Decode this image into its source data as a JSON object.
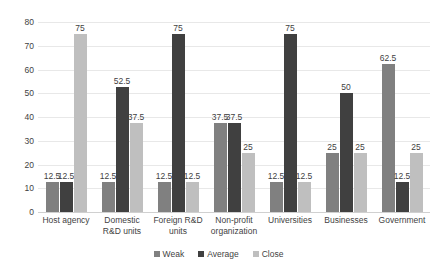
{
  "chart_data": {
    "type": "bar",
    "title": "",
    "xlabel": "",
    "ylabel": "",
    "ylim": [
      0,
      80
    ],
    "yticks": [
      0,
      10,
      20,
      30,
      40,
      50,
      60,
      70,
      80
    ],
    "grid": true,
    "legend_position": "bottom",
    "categories": [
      "Host agency",
      "Domestic R&D units",
      "Foreign R&D units",
      "Non-profit organization",
      "Universities",
      "Businesses",
      "Government"
    ],
    "series": [
      {
        "name": "Weak",
        "color": "#808080",
        "values": [
          12.5,
          12.5,
          12.5,
          37.5,
          12.5,
          25,
          62.5
        ],
        "labels": [
          "12.5",
          "12.5",
          "12.5",
          "37.5",
          "12.5",
          "25",
          "62.5"
        ]
      },
      {
        "name": "Average",
        "color": "#404040",
        "values": [
          12.5,
          52.5,
          75,
          37.5,
          75,
          50,
          12.5
        ],
        "labels": [
          "12.5",
          "52.5",
          "75",
          "37.5",
          "75",
          "50",
          "12.5"
        ]
      },
      {
        "name": "Close",
        "color": "#bfbfbf",
        "values": [
          75,
          37.5,
          12.5,
          25,
          12.5,
          25,
          25
        ],
        "labels": [
          "75",
          "37.5",
          "12.5",
          "25",
          "12.5",
          "25",
          "25"
        ]
      }
    ]
  },
  "axis": {
    "ytick_labels": [
      "80",
      "70",
      "60",
      "50",
      "40",
      "30",
      "20",
      "10",
      "0"
    ]
  },
  "legend": {
    "items": [
      {
        "label": "Weak",
        "color": "#808080"
      },
      {
        "label": "Average",
        "color": "#404040"
      },
      {
        "label": "Close",
        "color": "#bfbfbf"
      }
    ]
  }
}
